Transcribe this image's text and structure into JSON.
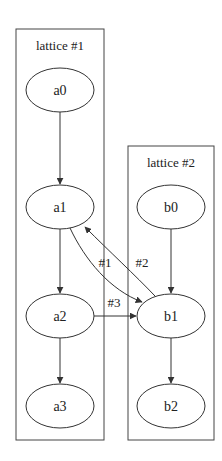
{
  "clusters": [
    {
      "label": "lattice #1",
      "x": 16,
      "y": 29,
      "w": 88,
      "h": 411
    },
    {
      "label": "lattice #2",
      "x": 128,
      "y": 146,
      "w": 86,
      "h": 294
    }
  ],
  "nodes": {
    "a0": {
      "label": "a0",
      "cx": 60,
      "cy": 90
    },
    "a1": {
      "label": "a1",
      "cx": 60,
      "cy": 207
    },
    "a2": {
      "label": "a2",
      "cx": 60,
      "cy": 316
    },
    "a3": {
      "label": "a3",
      "cx": 60,
      "cy": 406
    },
    "b0": {
      "label": "b0",
      "cx": 171,
      "cy": 207
    },
    "b1": {
      "label": "b1",
      "cx": 171,
      "cy": 316
    },
    "b2": {
      "label": "b2",
      "cx": 171,
      "cy": 406
    }
  },
  "edges": [
    {
      "from": "a0",
      "to": "a1",
      "label": ""
    },
    {
      "from": "a1",
      "to": "a2",
      "label": ""
    },
    {
      "from": "a2",
      "to": "a3",
      "label": ""
    },
    {
      "from": "b0",
      "to": "b1",
      "label": ""
    },
    {
      "from": "b1",
      "to": "b2",
      "label": ""
    },
    {
      "from": "a1",
      "to": "b1",
      "label": "#1"
    },
    {
      "from": "b1",
      "to": "a1",
      "label": "#2"
    },
    {
      "from": "a2",
      "to": "b1",
      "label": "#3"
    }
  ],
  "edge_labels": {
    "e1": "#1",
    "e2": "#2",
    "e3": "#3"
  }
}
